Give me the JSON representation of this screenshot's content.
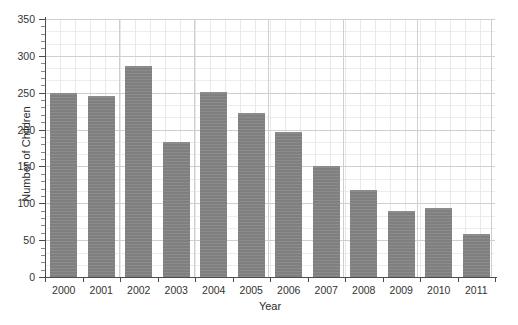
{
  "chart_data": {
    "type": "bar",
    "title": "",
    "xlabel": "Year",
    "ylabel": "Number of Children",
    "categories": [
      "2000",
      "2001",
      "2002",
      "2003",
      "2004",
      "2005",
      "2006",
      "2007",
      "2008",
      "2009",
      "2010",
      "2011"
    ],
    "values": [
      250,
      246,
      286,
      183,
      251,
      222,
      197,
      151,
      118,
      90,
      94,
      58
    ],
    "ylim": [
      0,
      350
    ],
    "yticks": [
      0,
      50,
      100,
      150,
      200,
      250,
      300,
      350
    ],
    "ytick_labels": [
      "0",
      "50",
      "100",
      "150",
      "200",
      "250",
      "300",
      "350"
    ],
    "grid": true,
    "grid_minor": true,
    "legend": "none",
    "bar_color": "#7f7f7f",
    "axis_color": "#4d4d4d",
    "grid_major_color": "#cfcfcf",
    "grid_minor_color": "#ededed",
    "background": "#ffffff"
  }
}
